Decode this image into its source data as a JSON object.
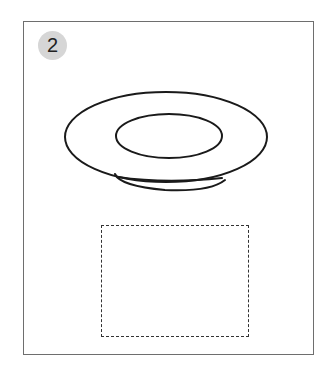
{
  "question": {
    "number": "2",
    "figure": "plate-side-view",
    "answer_area": "empty-dashed-box"
  },
  "colors": {
    "frame": "#6e6e6e",
    "badge_bg": "#d6d6d6",
    "stroke": "#1a1a1a"
  }
}
